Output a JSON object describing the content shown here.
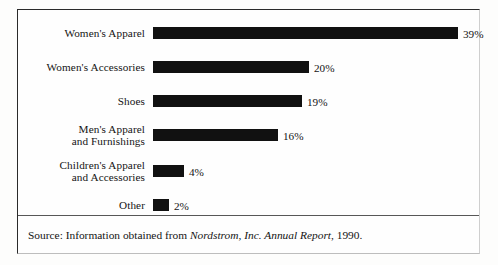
{
  "figure": {
    "source_prefix": "Source: Information obtained from ",
    "source_italic": "Nordstrom, Inc. Annual Report",
    "source_suffix": ", 1990."
  },
  "chart_data": {
    "type": "bar",
    "orientation": "horizontal",
    "title": "",
    "xlabel": "",
    "ylabel": "",
    "xlim": [
      0,
      39
    ],
    "grid": false,
    "legend": false,
    "value_suffix": "%",
    "categories": [
      "Women's Apparel",
      "Women's Accessories",
      "Shoes",
      "Men's Apparel and Furnishings",
      "Children's Apparel and Accessories",
      "Other"
    ],
    "values": [
      39,
      20,
      19,
      16,
      4,
      2
    ],
    "bars": [
      {
        "label_line1": "Women's Apparel",
        "label_line2": "",
        "value": 39,
        "value_label": "39%"
      },
      {
        "label_line1": "Women's Accessories",
        "label_line2": "",
        "value": 20,
        "value_label": "20%"
      },
      {
        "label_line1": "Shoes",
        "label_line2": "",
        "value": 19,
        "value_label": "19%"
      },
      {
        "label_line1": "Men's Apparel",
        "label_line2": "and Furnishings",
        "value": 16,
        "value_label": "16%"
      },
      {
        "label_line1": "Children's Apparel",
        "label_line2": "and Accessories",
        "value": 4,
        "value_label": "4%"
      },
      {
        "label_line1": "Other",
        "label_line2": "",
        "value": 2,
        "value_label": "2%"
      }
    ],
    "colors": {
      "bar": "#111111",
      "text": "#141414",
      "frame": "#2a2a2a",
      "background": "#fefefe"
    }
  }
}
